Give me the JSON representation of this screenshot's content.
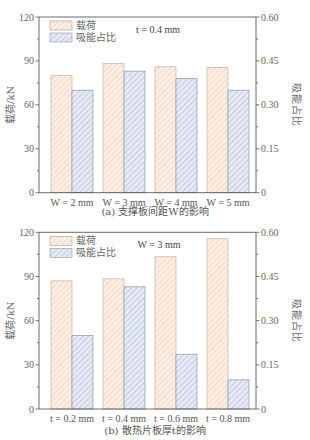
{
  "colors": {
    "load_fill": "#fbeee4",
    "load_hatch": "#e9c2a6",
    "absorb_fill": "#e5eaf4",
    "absorb_hatch": "#9aa8c6",
    "bar_stroke": "#8a8a8a",
    "axis": "#444444"
  },
  "legend": {
    "load": "载荷",
    "absorb": "吸能占比"
  },
  "chart_data": [
    {
      "id": "a",
      "type": "bar",
      "title": "(a) 支撑板间距W的影响",
      "annotation": "t=0.4 mm",
      "xlabel": "",
      "ylabel": "载荷/kN",
      "y2label": "吸能占比",
      "ylim": [
        0,
        120
      ],
      "y2lim": [
        0,
        0.6
      ],
      "yticks": [
        "0",
        "30",
        "60",
        "90",
        "120"
      ],
      "y2ticks": [
        "0",
        "0.15",
        "0.30",
        "0.45",
        "0.60"
      ],
      "categories": [
        "W=2 mm",
        "W=3 mm",
        "W=4 mm",
        "W=5 mm"
      ],
      "series": [
        {
          "name": "载荷",
          "axis": "left",
          "values": [
            80,
            88.3,
            86,
            85.5
          ]
        },
        {
          "name": "吸能占比",
          "axis": "right",
          "values": [
            0.35,
            0.415,
            0.39,
            0.35
          ]
        }
      ],
      "grid": false,
      "legend_position": "upper-left"
    },
    {
      "id": "b",
      "type": "bar",
      "title": "(b) 散热片板厚t的影响",
      "annotation": "W=3 mm",
      "xlabel": "",
      "ylabel": "载荷/kN",
      "y2label": "吸能占比",
      "ylim": [
        0,
        120
      ],
      "y2lim": [
        0,
        0.6
      ],
      "yticks": [
        "0",
        "30",
        "60",
        "90",
        "120"
      ],
      "y2ticks": [
        "0",
        "0.15",
        "0.30",
        "0.45",
        "0.60"
      ],
      "categories": [
        "t=0.2 mm",
        "t=0.4 mm",
        "t=0.6 mm",
        "t=0.8 mm"
      ],
      "series": [
        {
          "name": "载荷",
          "axis": "left",
          "values": [
            87,
            88.4,
            103.4,
            115.6
          ]
        },
        {
          "name": "吸能占比",
          "axis": "right",
          "values": [
            0.25,
            0.415,
            0.186,
            0.099
          ]
        }
      ],
      "grid": false,
      "legend_position": "upper-left"
    }
  ]
}
